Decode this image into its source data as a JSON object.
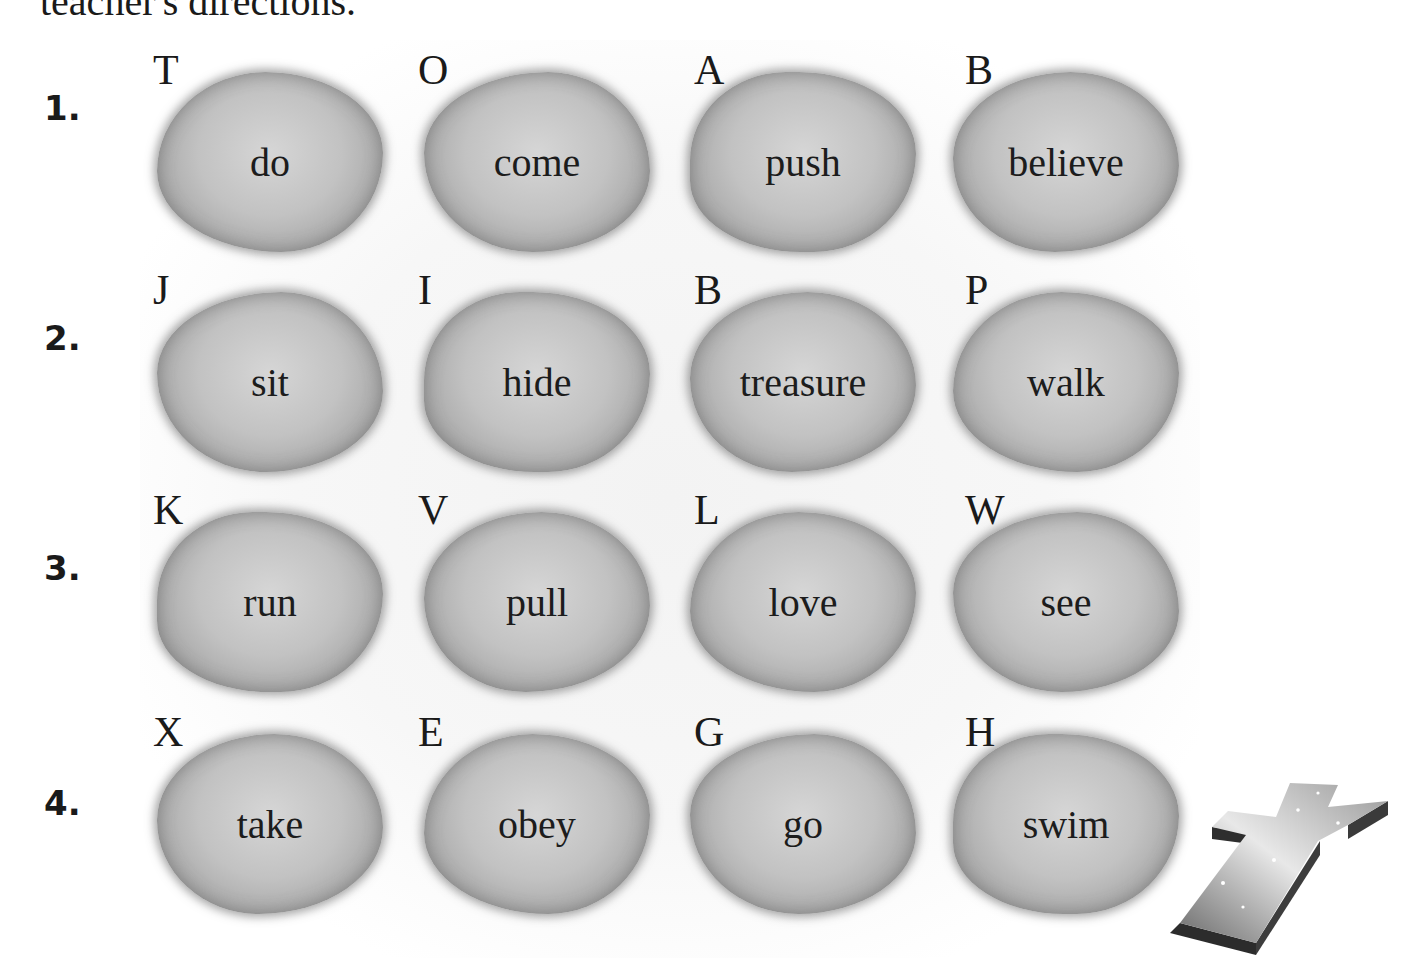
{
  "header": {
    "cut_off_text": "teacher's directions."
  },
  "rows": [
    {
      "number": "1.",
      "stones": [
        {
          "letter": "T",
          "word": "do"
        },
        {
          "letter": "O",
          "word": "come"
        },
        {
          "letter": "A",
          "word": "push"
        },
        {
          "letter": "B",
          "word": "believe"
        }
      ]
    },
    {
      "number": "2.",
      "stones": [
        {
          "letter": "J",
          "word": "sit"
        },
        {
          "letter": "I",
          "word": "hide"
        },
        {
          "letter": "B",
          "word": "treasure"
        },
        {
          "letter": "P",
          "word": "walk"
        }
      ]
    },
    {
      "number": "3.",
      "stones": [
        {
          "letter": "K",
          "word": "run"
        },
        {
          "letter": "V",
          "word": "pull"
        },
        {
          "letter": "L",
          "word": "love"
        },
        {
          "letter": "W",
          "word": "see"
        }
      ]
    },
    {
      "number": "4.",
      "stones": [
        {
          "letter": "X",
          "word": "take"
        },
        {
          "letter": "E",
          "word": "obey"
        },
        {
          "letter": "G",
          "word": "go"
        },
        {
          "letter": "H",
          "word": "swim"
        }
      ]
    }
  ],
  "decoration": {
    "icon": "cross-icon"
  }
}
